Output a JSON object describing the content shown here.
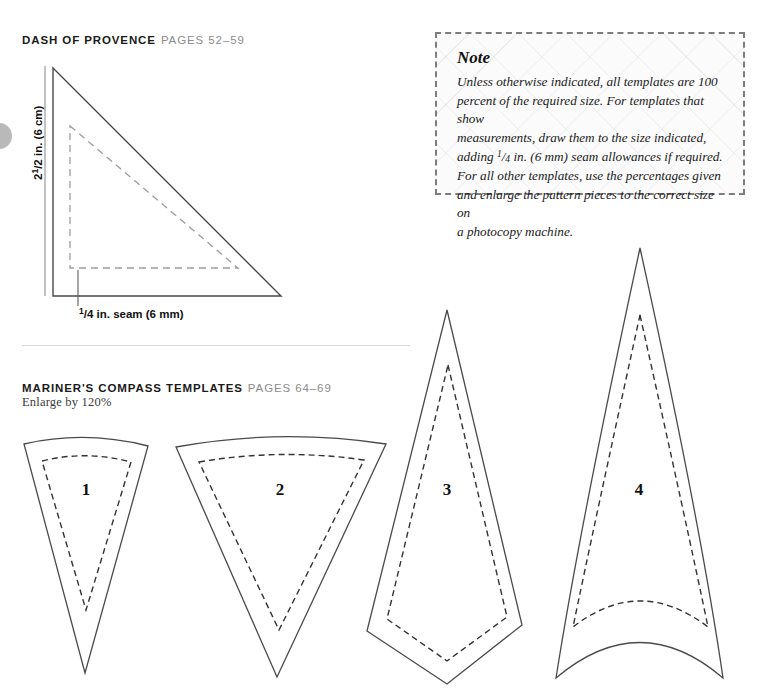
{
  "page": {
    "background_color": "#ffffff",
    "edge_marker_color": "#b9b9b9"
  },
  "sections": [
    {
      "id": "dash-of-provence",
      "title": "DASH OF PROVENCE",
      "pages": "PAGES 52–59",
      "subtitle": ""
    },
    {
      "id": "mariners-compass",
      "title": "MARINER'S COMPASS TEMPLATES",
      "pages": "PAGES 64–69",
      "subtitle": "Enlarge by 120%"
    }
  ],
  "note": {
    "title": "Note",
    "line1": "Unless otherwise indicated, all templates are 100",
    "line2": "percent of the required size. For templates that show",
    "line3": "measurements, draw them to the size indicated,",
    "line4_a": "adding ",
    "line4_frac_num": "1",
    "line4_slash": "/",
    "line4_frac_den": "4",
    "line4_b": " in. (6 mm) seam allowances if required.",
    "line5": "For all other templates, use the percentages given",
    "line6": "and enlarge the pattern pieces to the correct size on",
    "line7": "a photocopy machine.",
    "border_color": "#7d7d7d",
    "background_color": "#fbfbfb"
  },
  "triangle_template": {
    "height_label_num": "1",
    "height_label_whole": "2",
    "height_label_slash": "/",
    "height_label_den": "2",
    "height_label_rest": " in. (6 cm)",
    "seam_label_num": "1",
    "seam_label_slash": "/",
    "seam_label_den": "4",
    "seam_label_rest": " in. seam (6 mm)",
    "cut_line_color": "#444444",
    "seam_line_color": "#9a9a9a",
    "measure_bar_color": "#b0b0b0"
  },
  "compass_templates": [
    {
      "number": "1",
      "label_x": 86,
      "label_y": 490
    },
    {
      "number": "2",
      "label_x": 280,
      "label_y": 490
    },
    {
      "number": "3",
      "label_x": 447,
      "label_y": 490
    },
    {
      "number": "4",
      "label_x": 639,
      "label_y": 490
    }
  ],
  "colors": {
    "title": "#1a1a1a",
    "pages": "#8c8c8c",
    "divider": "#d8d8d8",
    "outline": "#444444",
    "dash": "#333333"
  }
}
